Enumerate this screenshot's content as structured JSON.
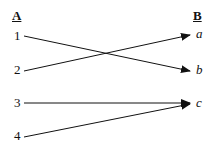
{
  "diagram": {
    "left_header": "A",
    "right_header": "B",
    "left_items": [
      {
        "label": "1",
        "x": 14,
        "y": 29
      },
      {
        "label": "2",
        "x": 14,
        "y": 63
      },
      {
        "label": "3",
        "x": 14,
        "y": 96
      },
      {
        "label": "4",
        "x": 14,
        "y": 129
      }
    ],
    "right_items": [
      {
        "label": "a",
        "x": 195,
        "y": 27
      },
      {
        "label": "b",
        "x": 195,
        "y": 63
      },
      {
        "label": "c",
        "x": 195,
        "y": 96
      }
    ],
    "connections": [
      {
        "from": "1",
        "to": "b"
      },
      {
        "from": "2",
        "to": "a"
      },
      {
        "from": "3",
        "to": "c"
      },
      {
        "from": "4",
        "to": "c"
      }
    ],
    "line_color": "#111111"
  }
}
